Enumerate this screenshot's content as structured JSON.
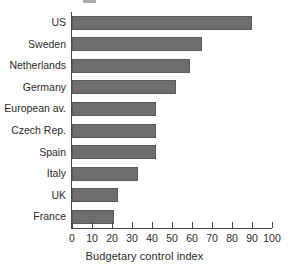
{
  "chart_data": {
    "type": "bar",
    "orientation": "horizontal",
    "title": "",
    "xlabel": "Budgetary control index",
    "ylabel": "",
    "categories": [
      "US",
      "Sweden",
      "Netherlands",
      "Germany",
      "European av.",
      "Czech Rep.",
      "Spain",
      "Italy",
      "UK",
      "France"
    ],
    "values": [
      90,
      65,
      59,
      52,
      42,
      42,
      42,
      33,
      23,
      21
    ],
    "xlim": [
      0,
      100
    ],
    "xticks": [
      0,
      10,
      20,
      30,
      40,
      50,
      60,
      70,
      80,
      90,
      100
    ],
    "xtick_labels": [
      "0",
      "10",
      "20",
      "30",
      "40",
      "50",
      "60",
      "70",
      "80",
      "90",
      "100"
    ],
    "grid": false,
    "legend": null,
    "bar_color": "#6e6e6e",
    "axis_color": "#4a4a4a",
    "background": "#ffffff"
  },
  "figure": {
    "cropped_title_remnant": "",
    "axis_title": "Budgetary control index"
  }
}
